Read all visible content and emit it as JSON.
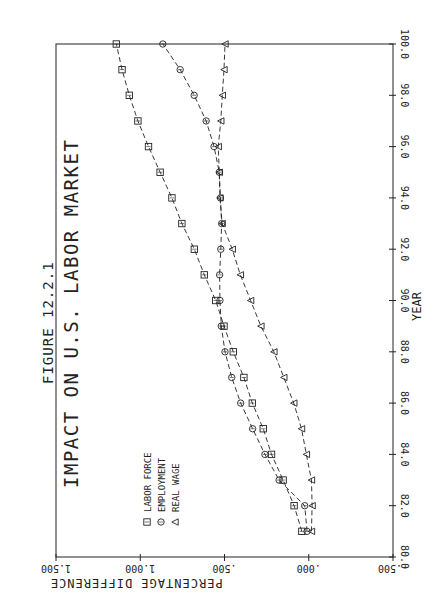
{
  "figure": {
    "number_label": "FIGURE 12.2.1",
    "title": "IMPACT ON U.S. LABOR MARKET"
  },
  "chart_data": {
    "type": "line",
    "title": "IMPACT ON U.S. LABOR MARKET",
    "subtitle": "FIGURE 12.2.1",
    "xlabel": "YEAR",
    "ylabel": "PERCENTAGE DIFFERENCE",
    "xlim": [
      80.0,
      100.0
    ],
    "ylim": [
      -0.5,
      1.5
    ],
    "x_ticks": [
      "80.0",
      "82.0",
      "84.0",
      "86.0",
      "88.0",
      "90.0",
      "92.0",
      "94.0",
      "96.0",
      "98.0",
      "100.0"
    ],
    "y_ticks": [
      "-.500",
      ".000",
      ".500",
      "1.000",
      "1.500"
    ],
    "orientation": "rotated 90 degrees (page printed sideways)",
    "grid": false,
    "legend_position": "lower-left inside plot",
    "x": [
      81,
      82,
      83,
      84,
      85,
      86,
      87,
      88,
      89,
      90,
      91,
      92,
      93,
      94,
      95,
      96,
      97,
      98,
      99,
      100
    ],
    "series": [
      {
        "name": "LABOR FORCE",
        "marker": "square",
        "values": [
          0.041,
          0.087,
          0.152,
          0.221,
          0.27,
          0.335,
          0.385,
          0.448,
          0.503,
          0.552,
          0.62,
          0.679,
          0.753,
          0.812,
          0.882,
          0.951,
          1.014,
          1.065,
          1.108,
          1.142
        ]
      },
      {
        "name": "EMPLOYMENT",
        "marker": "circle",
        "values": [
          0.01,
          0.024,
          0.176,
          0.26,
          0.333,
          0.404,
          0.457,
          0.497,
          0.519,
          0.527,
          0.529,
          0.522,
          0.517,
          0.524,
          0.531,
          0.562,
          0.609,
          0.68,
          0.763,
          0.866
        ]
      },
      {
        "name": "REAL WAGE",
        "marker": "triangle",
        "values": [
          -0.016,
          -0.02,
          -0.016,
          0.014,
          0.043,
          0.089,
          0.148,
          0.207,
          0.284,
          0.345,
          0.406,
          0.454,
          0.514,
          0.527,
          0.531,
          0.537,
          0.522,
          0.513,
          0.503,
          0.497
        ]
      }
    ]
  },
  "legend": {
    "items": [
      {
        "label": "LABOR FORCE",
        "marker": "square"
      },
      {
        "label": "EMPLOYMENT",
        "marker": "circle"
      },
      {
        "label": "REAL WAGE",
        "marker": "triangle"
      }
    ]
  },
  "colors": {
    "ink": "#222222",
    "paper": "#ffffff"
  }
}
